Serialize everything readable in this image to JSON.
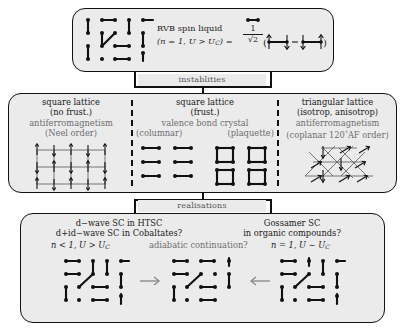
{
  "figure": {
    "top_box": {
      "name": "RVB spin liquid",
      "label_main": "RVB spin liquid",
      "label_cond": "(n = 1, U > U",
      "label_cond_sub": "C",
      "label_cond_end": ") =",
      "fraction_numerator": "1",
      "fraction_denominator": "√2",
      "singlet_expr": "( ↑↓ − ↓↑ )",
      "lattice_type": "dimer-covering"
    },
    "connector_1": {
      "label": "instablities"
    },
    "connector_2": {
      "label": "realisations"
    },
    "middle_box": {
      "columns": [
        {
          "id": "square-no-frust",
          "title_1": "square lattice",
          "title_2": "(no frust.)",
          "title_3": "antiferromagnetism",
          "title_4": "(Neel order)",
          "diagram": "neel-square-lattice"
        },
        {
          "id": "square-frust",
          "title_1": "square lattice",
          "title_2": "(frust.)",
          "title_3": "valence bond crystal",
          "sub_left": "(columnar)",
          "sub_right": "(plaquette)",
          "diagram": "vbc-columnar-plaquette"
        },
        {
          "id": "triangular",
          "title_1": "triangular lattice",
          "title_2": "(isotrop, anisotrop)",
          "title_3": "antiferromagnetism",
          "title_4a": "(coplanar 120",
          "title_4b": "°",
          "title_4c": "AF order)",
          "diagram": "triangular-120-af"
        }
      ]
    },
    "bottom_box": {
      "left_line_1": "d−wave SC in HTSC",
      "left_line_2": "d+id−wave SC in Cobaltates?",
      "right_line_1": "Gossamer SC",
      "right_line_2": "in organic compounds?",
      "cond_left": "n < 1, U > U",
      "cond_left_sub": "C",
      "cond_middle": "adiabatic continuation?",
      "cond_right": "n = 1, U ∼ U",
      "cond_right_sub": "C",
      "arrow_right": "→",
      "arrow_left": "←",
      "diagram": "three-dimer-coverings"
    },
    "colors": {
      "panel_fill": "#ebebeb",
      "border": "#111111",
      "dim_text": "#6e6e6e",
      "arrow_gray": "#8b8b8b"
    }
  }
}
